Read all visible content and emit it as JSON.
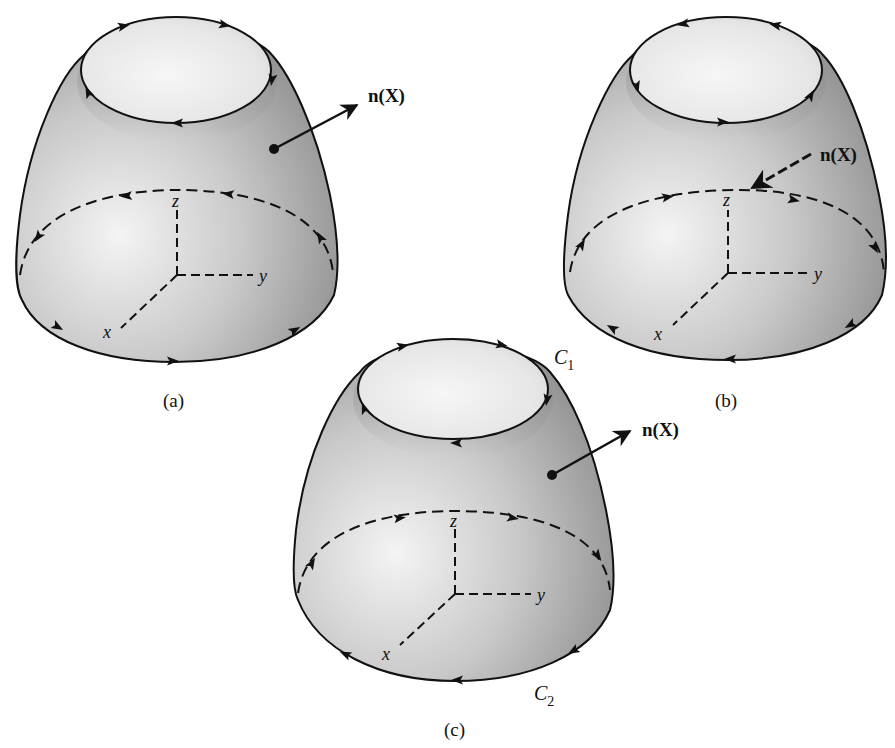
{
  "figure": {
    "panels": [
      {
        "id": "a",
        "caption": "(a)",
        "normal_label": "n(X)",
        "normal_direction": "outward",
        "axis_labels": {
          "x": "x",
          "y": "y",
          "z": "z"
        },
        "top_curve_orientation": "counterclockwise-from-above-view (arrows: right on back, left on front)",
        "bottom_curve_orientation": "arrows left on back dashed, right on front"
      },
      {
        "id": "b",
        "caption": "(b)",
        "normal_label": "n(X)",
        "normal_direction": "inward",
        "axis_labels": {
          "x": "x",
          "y": "y",
          "z": "z"
        },
        "top_curve_orientation": "arrows left on back, right on front",
        "bottom_curve_orientation": "arrows right on back dashed, left on front"
      },
      {
        "id": "c",
        "caption": "(c)",
        "normal_label": "n(X)",
        "normal_direction": "outward",
        "axis_labels": {
          "x": "x",
          "y": "y",
          "z": "z"
        },
        "curve_labels": {
          "top": "C",
          "top_sub": "1",
          "bottom": "C",
          "bottom_sub": "2"
        },
        "top_curve_orientation": "arrows right on back, left on front",
        "bottom_curve_orientation": "arrows right on back dashed, left on front"
      }
    ],
    "colors": {
      "ink": "#111111",
      "surface_light": "#f2f2f2",
      "surface_mid": "#bdbdbd",
      "surface_dark": "#8a8a8a",
      "background": "#ffffff"
    }
  }
}
